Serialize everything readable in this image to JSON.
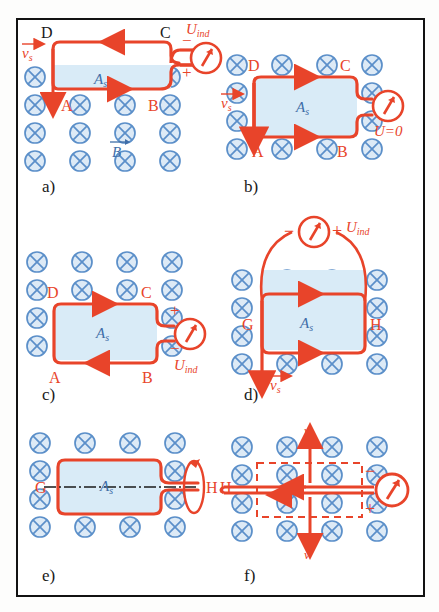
{
  "figure": {
    "colors": {
      "wire_red": "#e8442a",
      "field_blue": "#5b8fc9",
      "field_fill": "#ddeaf6",
      "area_fill": "#d9ebf7",
      "area_label_blue": "#3f6ea8",
      "frame_black": "#121212",
      "axis_black": "#1a1a1a"
    },
    "field_symbol": "circle-with-x",
    "field_label": "B-vector"
  },
  "panels": [
    {
      "id": "a",
      "caption": "a)",
      "corners": [
        "D",
        "C",
        "A",
        "B"
      ],
      "area_label": "A",
      "area_sub": "s",
      "meter_label": "U",
      "meter_sub": "ind",
      "terminal_top": "−",
      "terminal_bottom": "+",
      "velocity_label": "v",
      "velocity_sub": "s",
      "velocity_dir": "down",
      "field_label": "B",
      "current_top_dir": "left",
      "current_bottom_dir": "right",
      "meter_position": "right"
    },
    {
      "id": "b",
      "caption": "b)",
      "corners": [
        "D",
        "C",
        "A",
        "B"
      ],
      "area_label": "A",
      "area_sub": "s",
      "meter_label": "U=0",
      "velocity_label": "v",
      "velocity_sub": "s",
      "velocity_dir": "down",
      "current_top_dir": "right",
      "current_bottom_dir": "right",
      "meter_position": "right"
    },
    {
      "id": "c",
      "caption": "c)",
      "corners": [
        "D",
        "C",
        "A",
        "B"
      ],
      "area_label": "A",
      "area_sub": "s",
      "meter_label": "U",
      "meter_sub": "ind",
      "terminal_top": "+",
      "terminal_bottom": "−",
      "current_top_dir": "right",
      "current_bottom_dir": "left",
      "meter_position": "right"
    },
    {
      "id": "d",
      "caption": "d)",
      "corners": [
        "G",
        "H"
      ],
      "area_label": "A",
      "area_sub": "s",
      "meter_label": "U",
      "meter_sub": "ind",
      "terminal_left": "−",
      "terminal_right": "+",
      "velocity_label": "v",
      "velocity_sub": "s",
      "velocity_dir": "down",
      "current_top_dir": "right",
      "current_bottom_dir": "right",
      "meter_position": "top"
    },
    {
      "id": "e",
      "caption": "e)",
      "corners": [
        "G",
        "H"
      ],
      "area_label": "A",
      "area_sub": "s",
      "rotation_axis": "dash-dot",
      "rotation_arrow": "curved-arrow-right"
    },
    {
      "id": "f",
      "caption": "f)",
      "corners": [
        "H"
      ],
      "velocity_label_top": "v",
      "velocity_label_bottom": "v",
      "terminal_top": "−",
      "terminal_bottom": "+",
      "loop_outline": "dashed",
      "current_dir": "left",
      "meter_position": "right"
    }
  ]
}
